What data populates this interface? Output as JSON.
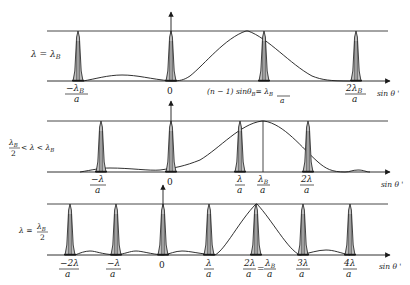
{
  "figure": {
    "axis_label": "sin θ '",
    "colors": {
      "ink": "#1a1a1a",
      "background": "#ffffff"
    }
  },
  "panels": [
    {
      "id": "panel-1",
      "condition": "λ = λ_B",
      "condition_parts": {
        "main": "λ = λ",
        "sub": "B"
      },
      "peaks": [
        {
          "pos_label": "−λ_B/a",
          "num": "−λ",
          "num_sub": "B",
          "den": "a"
        },
        {
          "pos_label": "0",
          "num": "0"
        },
        {
          "pos_label": "λ_B/a",
          "num": "(n − 1) sinθ",
          "num_sub": "B",
          "eq": "= λ",
          "eq_sub": "B",
          "den": "a"
        },
        {
          "pos_label": "2λ_B/a",
          "num": "2λ",
          "num_sub": "B",
          "den": "a"
        }
      ],
      "annotation": "(n − 1) sinθ_B = λ_B / a"
    },
    {
      "id": "panel-2",
      "condition": "λ_B/2 < λ < λ_B",
      "condition_parts": {
        "num": "λ",
        "num_sub": "B",
        "den": "2",
        "rest": "< λ < λ",
        "rest_sub": "B"
      },
      "peaks": [
        {
          "pos_label": "−λ/a",
          "num": "−λ",
          "den": "a"
        },
        {
          "pos_label": "0",
          "num": "0"
        },
        {
          "pos_label": "λ/a",
          "num": "λ",
          "den": "a"
        },
        {
          "pos_label": "2λ/a",
          "num": "2λ",
          "den": "a"
        }
      ],
      "envelope_marker": {
        "label": "λ_B/a",
        "num": "λ",
        "num_sub": "B",
        "den": "a"
      }
    },
    {
      "id": "panel-3",
      "condition": "λ = λ_B/2",
      "condition_parts": {
        "main": "λ =",
        "num": "λ",
        "num_sub": "B",
        "den": "2"
      },
      "peaks": [
        {
          "pos_label": "−2λ/a",
          "num": "−2λ",
          "den": "a"
        },
        {
          "pos_label": "−λ/a",
          "num": "−λ",
          "den": "a"
        },
        {
          "pos_label": "0",
          "num": "0"
        },
        {
          "pos_label": "λ/a",
          "num": "λ",
          "den": "a"
        },
        {
          "pos_label": "2λ/a = λ_B/a",
          "num": "2λ",
          "den": "a",
          "eq": "=",
          "eq_num": "λ",
          "eq_num_sub": "B",
          "eq_den": "a"
        },
        {
          "pos_label": "3λ/a",
          "num": "3λ",
          "den": "a"
        },
        {
          "pos_label": "4λ/a",
          "num": "4λ",
          "den": "a"
        }
      ]
    }
  ]
}
